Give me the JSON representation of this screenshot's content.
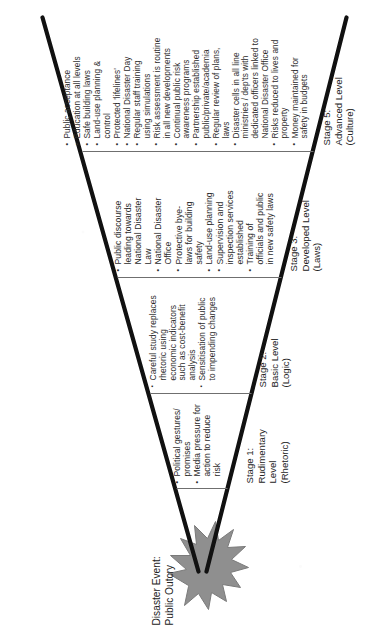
{
  "figure": {
    "type": "funnel-diagram",
    "orientation": "rotated-90-ccw",
    "event_label": "Disaster Event:\nPublic Outcry",
    "caption": "",
    "burst_icon": "starburst-icon",
    "colors": {
      "ink": "#2b2b2b",
      "outline": "#111111",
      "burst_fill": "#8f8f8f",
      "divider": "#6f6f6f",
      "paper": "#ffffff"
    }
  },
  "stages": [
    {
      "id": "stage-1",
      "caption": "Stage 1:\nRudimentary\nLevel\n(Rhetoric)",
      "name": "Stage 1: Rudimentary Level (Rhetoric)",
      "bullet_style": "round",
      "items": [
        "Political gestures/\npromises",
        "Media pressure for\naction to reduce\nrisk"
      ]
    },
    {
      "id": "stage-2",
      "caption": "Stage 2:\nBasic Level\n(Logic)",
      "name": "Stage 2: Basic Level (Logic)",
      "bullet_style": "square",
      "items": [
        "Careful study replaces\nrhetoric using\neconomic indicators\nsuch as cost-benefit\nanalysis",
        "Sensitisation of public\nto impending changes"
      ]
    },
    {
      "id": "stage-3",
      "caption": "Stage 3:\nDeveloped Level\n(Laws)",
      "name": "Stage 3: Developed Level (Laws)",
      "bullet_style": "round",
      "items": [
        "Public discourse\nleading towards\nNational Disaster\nLaw",
        "National Disaster\nOffice",
        "Protective bye-\nlaws for building\nsafety",
        "Land-use planning",
        "Supervision and\ninspection services\nestablished",
        "Training of\nofficials and public\nin new safety laws"
      ]
    },
    {
      "id": "stage-5",
      "caption": "Stage 5:\nAdvanced Level\n(Culture)",
      "name": "Stage 5: Advanced Level (Culture)",
      "bullet_style": "round",
      "items": [
        "Public acceptance",
        "Education at all levels",
        "Safe building laws",
        "Land-use planning &\ncontrol",
        "Protected 'lifelines'",
        "National Disaster Day",
        "Regular staff  training\nusing simulations",
        "Risk assessment is routine\nin all new developments",
        "Continual public risk\nawareness programs",
        "Partnership established\npublic/private/academia",
        "Regular review of plans,\nlaws",
        "Disaster cells in all line\nministries / dep'ts with\ndedicated officers linked to\nNational Disaster Office",
        "Risks reduced to lives and\nproperty",
        "Money maintained for\nsafety in budgets"
      ]
    }
  ]
}
